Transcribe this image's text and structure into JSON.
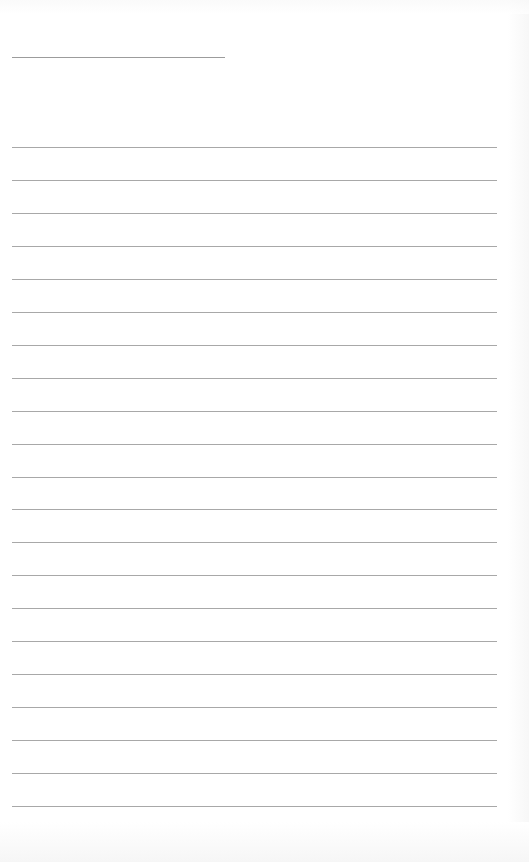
{
  "page": {
    "type": "lined-notebook-page",
    "header": {
      "title_text": ""
    },
    "ruled_lines": {
      "count": 21,
      "first_top": 147,
      "spacing": 32.95,
      "color": "#a8a8a8"
    },
    "header_line_color": "#9c9c9c",
    "background_color": "#ffffff"
  }
}
